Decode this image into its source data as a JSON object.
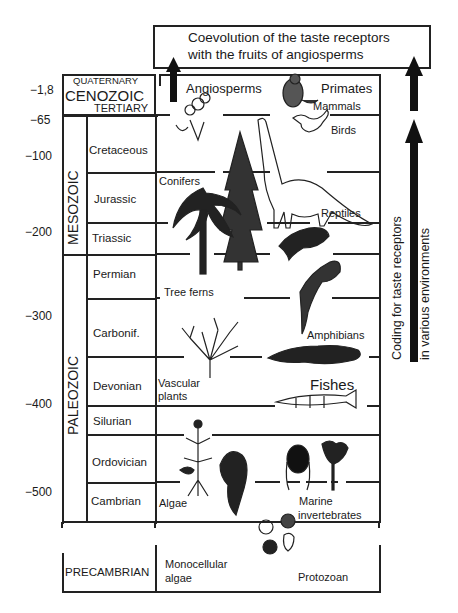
{
  "title_box": {
    "line1": "Coevolution of the taste receptors",
    "line2": "with the fruits of angiosperms"
  },
  "side_annotation": {
    "line1": "Coding for taste receptors",
    "line2": "in various environments"
  },
  "time_ticks": [
    "−1,8",
    "−65",
    "−100",
    "−200",
    "−300",
    "−400",
    "−500"
  ],
  "eras": {
    "cenozoic": "CENOZOIC",
    "quaternary": "QUATERNARY",
    "tertiary": "TERTIARY",
    "mesozoic": "MESOZOIC",
    "paleozoic": "PALEOZOIC",
    "precambrian": "PRECAMBRIAN"
  },
  "periods": [
    "Cretaceous",
    "Jurassic",
    "Triassic",
    "Permian",
    "Carbonif.",
    "Devonian",
    "Silurian",
    "Ordovician",
    "Cambrian"
  ],
  "organisms": {
    "angiosperms": "Angiosperms",
    "primates": "Primates",
    "mammals": "Mammals",
    "birds": "Birds",
    "conifers": "Conifers",
    "reptiles": "Reptiles",
    "tree_ferns": "Tree ferns",
    "amphibians": "Amphibians",
    "vascular_plants_1": "Vascular",
    "vascular_plants_2": "plants",
    "fishes": "Fishes",
    "algae": "Algae",
    "marine_invertebrates_1": "Marine",
    "marine_invertebrates_2": "invertebrates",
    "monocellular_algae_1": "Monocellular",
    "monocellular_algae_2": "algae",
    "protozoan": "Protozoan"
  },
  "colors": {
    "line": "#222222",
    "text": "#1a1a1a",
    "background": "#ffffff"
  }
}
